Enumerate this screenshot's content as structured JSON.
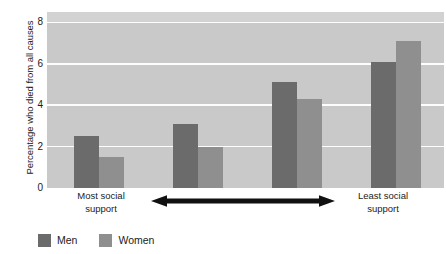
{
  "chart_data": {
    "type": "bar",
    "title": "",
    "subtitle": "",
    "xlabel": "",
    "ylabel": "Percentage who died from all causes",
    "categories": [
      "Group 1",
      "Group 2",
      "Group 3",
      "Group 4"
    ],
    "series": [
      {
        "name": "Men",
        "color": "#6b6b6b",
        "values": [
          2.5,
          3.1,
          5.1,
          6.1
        ]
      },
      {
        "name": "Women",
        "color": "#8f8f8f",
        "values": [
          1.5,
          2.0,
          4.3,
          7.1
        ]
      }
    ],
    "ylim": [
      0,
      8.5
    ],
    "yticks": [
      0,
      2,
      4,
      6,
      8
    ],
    "ytick_labels": [
      "0",
      "2",
      "4",
      "6",
      "8"
    ],
    "grid": "horizontal-white",
    "legend_position": "bottom-left",
    "plot_background": "#c9c9c9",
    "gridline_color": "#fdfdfd",
    "annotations": {
      "axis_left_label": "Most social support",
      "axis_right_label": "Least social support",
      "axis_arrow": "double-headed-horizontal-arrow"
    }
  },
  "y_axis": {
    "title": "Percentage who died from all causes",
    "ticks": [
      {
        "label": "8",
        "value": 8
      },
      {
        "label": "6",
        "value": 6
      },
      {
        "label": "4",
        "value": 4
      },
      {
        "label": "2",
        "value": 2
      },
      {
        "label": "0",
        "value": 0
      }
    ]
  },
  "x_axis": {
    "left_line1": "Most social",
    "left_line2": "support",
    "right_line1": "Least social",
    "right_line2": "support"
  },
  "legend": {
    "items": [
      {
        "label": "Men",
        "color": "#6b6b6b"
      },
      {
        "label": "Women",
        "color": "#8f8f8f"
      }
    ]
  }
}
